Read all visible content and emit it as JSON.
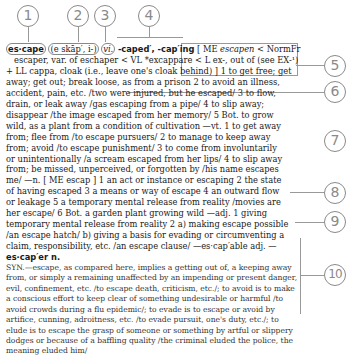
{
  "callouts": [
    "1",
    "2",
    "3",
    "4",
    "5",
    "6",
    "7",
    "8",
    "9",
    "10"
  ],
  "entry": {
    "headword": "es·cape",
    "pronunciation": "(e skāp′, i-)",
    "part_of_speech": "vi.",
    "inflections": "-caped′, -cap′ing",
    "etymology": "[ ME escapen < NormFr escaper, var. of eschaper < VL *excappare < L ex-, out of (see EX-¹) + LL cappa, cloak (i.e., leave one's cloak behind) ]",
    "lines": [
      "escaper, var. of eschaper < VL *excappare < L ex-, out of (see EX-¹)",
      "+ LL cappa, cloak (i.e., leave one's cloak behind) ]  1 to get free; get",
      "away; get out; break loose, as from a prison  2 to avoid an illness,",
      "accident, pain, etc. /two were injured, but he escaped/  3 to flow,",
      "drain, or leak away /gas escaping from a pipe/  4 to slip away;",
      "disappear /the image escaped from her memory/  5 Bot. to grow",
      "wild, as a plant from a condition of cultivation —vt. 1 to get away",
      "from; flee from /to escape pursuers/  2 to manage to keep away",
      "from; avoid /to escape punishment/  3 to come from involuntarily",
      "or unintentionally /a scream escaped from her lips/  4 to slip away",
      "from; be missed, unperceived, or forgotten by /his name escapes",
      "me/ —n. [ ME escap ]  1 an act or instance or escaping  2 the state",
      "of having escaped  3 a means or way of escape  4 an outward flow",
      "or leakage  5 a temporary mental release from reality /movies are",
      "her escape/  6 Bot. a garden plant growing wild —adj. 1 giving",
      "temporary mental release from reality  2 a) making escape possible",
      "/an escape hatch/  b) giving a basis for evading or circumventing a",
      "claim, responsibility, etc. /an escape clause/ —es·cap′able adj. —",
      "es·cap′er n."
    ],
    "synonym_note": [
      "SYN.—escape, as compared here, implies a getting out of, a keeping away",
      "from, or simply a remaining unaffected by an impending or present danger,",
      "evil, confinement, etc. /to escape death, criticism, etc./; to avoid is to make",
      "a conscious effort to keep clear of something undesirable or harmful /to",
      "avoid crowds during a flu epidemic/; to evade is to escape or avoid by",
      "artifice, cunning, adroitness, etc. /to evade pursuit, one's duty, etc./; to",
      "elude is to escape the grasp of someone or something by artful or slippery",
      "dodges or because of a baffling quality /the criminal eluded the police, the",
      "meaning eluded him/"
    ]
  }
}
